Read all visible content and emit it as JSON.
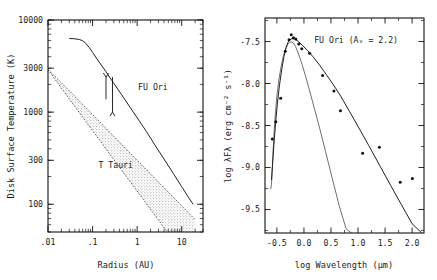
{
  "figure": {
    "background": "#ffffff",
    "ink": "#111111"
  },
  "left_panel": {
    "xlabel": "Radius (AU)",
    "ylabel": "Disk Surface Temperature (K)",
    "x_ticklabels": [
      ".01",
      ".1",
      "1",
      "10"
    ],
    "y_ticklabels": [
      "10000",
      "3000",
      "1000",
      "300",
      "100"
    ],
    "annotation_fu_ori": "FU Ori",
    "annotation_t_tauri": "T Tauri"
  },
  "right_panel": {
    "xlabel": "log Wavelength (μm)",
    "ylabel": "log λFλ (erg cm⁻² s⁻¹)",
    "x_ticklabels": [
      "-0.5",
      "0.0",
      "0.5",
      "1.0",
      "1.5",
      "2.0"
    ],
    "y_ticklabels": [
      "-7.5",
      "-8.0",
      "-8.5",
      "-9.0",
      "-9.5"
    ],
    "annotation": "FU Ori (Aᵥ = 2.2)"
  },
  "chart_data": [
    {
      "type": "line",
      "panel": "left",
      "title": "",
      "xlabel": "Radius (AU)",
      "ylabel": "Disk Surface Temperature (K)",
      "xscale": "log",
      "yscale": "log",
      "xlim": [
        0.01,
        30
      ],
      "ylim": [
        50,
        10000
      ],
      "xticks": [
        0.01,
        0.1,
        1,
        10
      ],
      "xticklabels": [
        ".01",
        ".1",
        "1",
        "10"
      ],
      "yticks": [
        10000,
        3000,
        1000,
        300,
        100
      ],
      "yticklabels": [
        "10000",
        "3000",
        "1000",
        "300",
        "100"
      ],
      "grid": false,
      "legend": "none",
      "series": [
        {
          "name": "FU Ori",
          "style": "solid",
          "label_position": {
            "x": 1.05,
            "y": 1750
          },
          "x": [
            0.03,
            0.04,
            0.05,
            0.06,
            0.07,
            0.085,
            0.1,
            0.14,
            0.2,
            0.3,
            0.45,
            0.7,
            1.0,
            1.6,
            2.5,
            4.0,
            6.5,
            10.0,
            14.0,
            18.0
          ],
          "y": [
            6300,
            6250,
            6150,
            5950,
            5600,
            5000,
            4450,
            3500,
            2750,
            2050,
            1540,
            1120,
            870,
            620,
            440,
            310,
            215,
            155,
            120,
            100
          ]
        },
        {
          "name": "T Tauri band upper edge",
          "style": "dashed",
          "x": [
            0.01,
            0.02,
            0.04,
            0.08,
            0.16,
            0.32,
            0.65,
            1.3,
            2.6,
            5.2,
            10.0,
            20.0
          ],
          "y": [
            2900,
            2080,
            1480,
            1050,
            745,
            528,
            372,
            264,
            187,
            133,
            96,
            68
          ]
        },
        {
          "name": "T Tauri band lower edge",
          "style": "dashed",
          "x": [
            0.01,
            0.02,
            0.04,
            0.08,
            0.16,
            0.32,
            0.65,
            1.3,
            2.6,
            5.2,
            10.0,
            20.0
          ],
          "y": [
            2900,
            1820,
            1150,
            730,
            462,
            292,
            184,
            117,
            74,
            47,
            30,
            19
          ]
        }
      ],
      "shaded_band": {
        "name": "T Tauri",
        "fill": "hatched",
        "label_position": {
          "x": 0.33,
          "y": 250
        }
      },
      "arrows": [
        {
          "name": "up-arrow",
          "x": 0.2,
          "y_from": 1380,
          "y_to": 2400,
          "direction": "up"
        },
        {
          "name": "down-arrow",
          "x": 0.28,
          "y_from": 2400,
          "y_to": 1000,
          "direction": "down"
        }
      ]
    },
    {
      "type": "scatter",
      "panel": "right",
      "title": "",
      "xlabel": "log Wavelength (μm)",
      "ylabel": "log λFλ (erg cm⁻² s⁻¹)",
      "annotation": "FU Ori (Aᵥ = 2.2)",
      "xlim": [
        -0.72,
        2.22
      ],
      "ylim": [
        -9.78,
        -7.22
      ],
      "xticks": [
        -0.5,
        0.0,
        0.5,
        1.0,
        1.5,
        2.0
      ],
      "xticklabels": [
        "-0.5",
        "0.0",
        "0.5",
        "1.0",
        "1.5",
        "2.0"
      ],
      "yticks": [
        -7.5,
        -8.0,
        -8.5,
        -9.0,
        -9.5
      ],
      "yticklabels": [
        "-7.5",
        "-8.0",
        "-8.5",
        "-9.0",
        "-9.5"
      ],
      "grid": false,
      "legend": "none",
      "observations": {
        "name": "FU Ori observed SED",
        "marker": "dot",
        "x": [
          -0.585,
          -0.52,
          -0.43,
          -0.345,
          -0.275,
          -0.235,
          -0.195,
          -0.15,
          -0.095,
          -0.04,
          0.105,
          0.345,
          0.555,
          0.675,
          1.085,
          1.395,
          1.78,
          2.005
        ],
        "y": [
          -8.66,
          -8.455,
          -8.175,
          -7.615,
          -7.48,
          -7.42,
          -7.455,
          -7.47,
          -7.53,
          -7.585,
          -7.64,
          -7.905,
          -8.09,
          -8.325,
          -8.83,
          -8.76,
          -9.175,
          -9.13
        ]
      },
      "series": [
        {
          "name": "disk model (thick)",
          "style": "solid",
          "x": [
            -0.6,
            -0.57,
            -0.545,
            -0.52,
            -0.49,
            -0.45,
            -0.41,
            -0.37,
            -0.33,
            -0.295,
            -0.26,
            -0.22,
            -0.17,
            -0.11,
            -0.03,
            0.07,
            0.18,
            0.3,
            0.42,
            0.54,
            0.68,
            0.84,
            1.0,
            1.2,
            1.4,
            1.6,
            1.8,
            2.0,
            2.18
          ],
          "y": [
            -9.15,
            -8.86,
            -8.64,
            -8.44,
            -8.23,
            -8.01,
            -7.83,
            -7.68,
            -7.57,
            -7.51,
            -7.48,
            -7.465,
            -7.47,
            -7.495,
            -7.545,
            -7.61,
            -7.69,
            -7.79,
            -7.9,
            -8.01,
            -8.15,
            -8.33,
            -8.51,
            -8.74,
            -8.975,
            -9.21,
            -9.44,
            -9.67,
            -9.78
          ]
        },
        {
          "name": "single-temperature model (thin)",
          "style": "solid-thin",
          "x": [
            -0.615,
            -0.6,
            -0.585,
            -0.57,
            -0.55,
            -0.525,
            -0.495,
            -0.46,
            -0.42,
            -0.38,
            -0.34,
            -0.3,
            -0.265,
            -0.23,
            -0.195,
            -0.155,
            -0.105,
            -0.05,
            0.02,
            0.1,
            0.19,
            0.29,
            0.4,
            0.52,
            0.65,
            0.78,
            0.88
          ],
          "y": [
            -9.26,
            -9.2,
            -9.02,
            -8.8,
            -8.56,
            -8.33,
            -8.12,
            -7.94,
            -7.79,
            -7.67,
            -7.59,
            -7.535,
            -7.51,
            -7.505,
            -7.52,
            -7.56,
            -7.64,
            -7.74,
            -7.89,
            -8.075,
            -8.29,
            -8.53,
            -8.81,
            -9.12,
            -9.45,
            -9.73,
            -9.78
          ]
        }
      ]
    }
  ]
}
